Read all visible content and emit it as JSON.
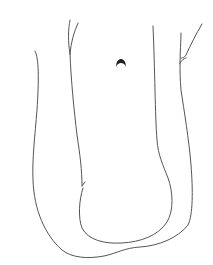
{
  "image": {
    "description": "Hand-drawn black line sketch on white background: two nested U-shaped outlines with forked tops and a small dark crescent mark near the top center",
    "background_color": "#ffffff",
    "ink_color": "#555555",
    "mark_color": "#222222",
    "elements": [
      {
        "name": "outer-outline",
        "description": "Large U-shaped outer contour"
      },
      {
        "name": "inner-outline",
        "description": "Inner U-shaped contour forming a loop at the bottom"
      },
      {
        "name": "left-fork",
        "description": "Forked (Y-shaped) top of inner left line"
      },
      {
        "name": "right-fork",
        "description": "Forked (Y-shaped) top of outer right line"
      },
      {
        "name": "crescent-mark",
        "description": "Small dark arch/crescent shape near top center"
      }
    ]
  }
}
